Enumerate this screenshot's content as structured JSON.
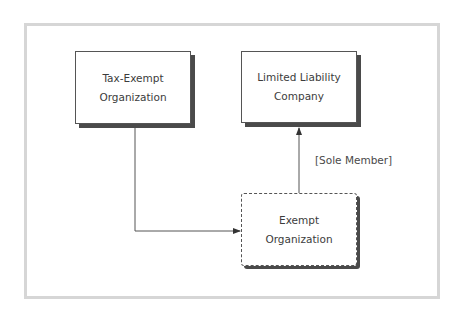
{
  "diagram": {
    "nodes": [
      {
        "id": "tax_exempt_org",
        "line1": "Tax-Exempt",
        "line2": "Organization",
        "style": "solid"
      },
      {
        "id": "llc",
        "line1": "Limited Liability",
        "line2": "Company",
        "style": "solid"
      },
      {
        "id": "exempt_org",
        "line1": "Exempt",
        "line2": "Organization",
        "style": "dashed"
      }
    ],
    "edges": [
      {
        "from": "tax_exempt_org",
        "to": "exempt_org",
        "label": ""
      },
      {
        "from": "exempt_org",
        "to": "llc",
        "label": "[Sole Member]"
      }
    ]
  },
  "colors": {
    "frame": "#d6d6d6",
    "line": "#555555",
    "shadow": "#4a4a4a",
    "text": "#3c3c3c"
  }
}
